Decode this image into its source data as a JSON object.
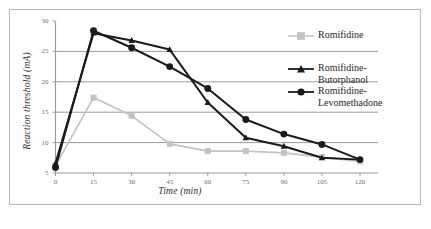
{
  "figure": {
    "background_color": "#ffffff",
    "border_color": "#b9b9b9"
  },
  "chart_data": {
    "type": "line",
    "title": "",
    "xlabel": "Time (min)",
    "ylabel": "Reaction threshold (mA)",
    "x": [
      0,
      15,
      30,
      45,
      60,
      75,
      90,
      105,
      120
    ],
    "xticklabels": [
      "0",
      "15",
      "30",
      "45",
      "60",
      "75",
      "90",
      "105",
      "120"
    ],
    "yticklabels": [
      "5",
      "10",
      "15",
      "20",
      "25",
      "30"
    ],
    "yticks": [
      5,
      10,
      15,
      20,
      25,
      30
    ],
    "xlim": [
      0,
      120
    ],
    "ylim": [
      5,
      30
    ],
    "grid": "horizontal",
    "legend_position": "right",
    "series": [
      {
        "name": "Romifidine",
        "color": "#c3c3c3",
        "marker": "square",
        "values": [
          6.2,
          17.4,
          14.4,
          9.8,
          8.6,
          8.6,
          8.3,
          7.6,
          6.9
        ]
      },
      {
        "name": "Romifidine-Butorphanol",
        "color": "#1a1a1a",
        "marker": "triangle",
        "values": [
          6.6,
          28.0,
          26.8,
          25.3,
          16.6,
          10.8,
          9.4,
          7.5,
          7.2
        ]
      },
      {
        "name": "Romifidine-Levomethadone",
        "color": "#1a1a1a",
        "marker": "circle",
        "values": [
          5.9,
          28.4,
          25.6,
          22.5,
          18.9,
          13.8,
          11.4,
          9.7,
          7.2
        ]
      }
    ]
  },
  "legend": {
    "items": [
      {
        "label": "Romifidine",
        "label_line2": ""
      },
      {
        "label": "Romifidine-",
        "label_line2": "Butorphanol"
      },
      {
        "label": "Romifidine-",
        "label_line2": "Levomethadone"
      }
    ]
  }
}
